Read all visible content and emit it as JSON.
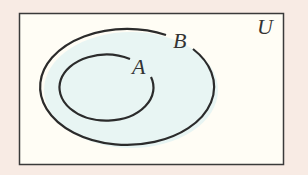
{
  "diagram": {
    "type": "venn",
    "universe_label": "U",
    "sets": [
      {
        "name": "B",
        "label": "B",
        "contains": [
          "A"
        ]
      },
      {
        "name": "A",
        "label": "A",
        "subset_of": "B"
      }
    ],
    "relation": "A ⊂ B ⊂ U",
    "colors": {
      "page_background": "#f8ebe4",
      "universe_fill": "#fffdf5",
      "set_fill": "#e8f5f3",
      "stroke": "#2b2b2b"
    }
  }
}
